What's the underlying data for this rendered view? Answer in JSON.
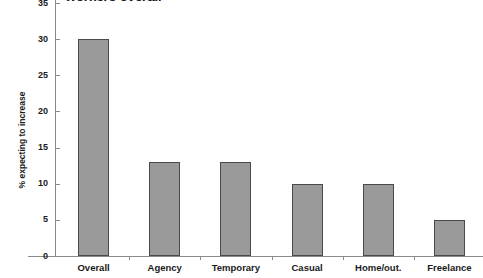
{
  "chart_data": {
    "type": "bar",
    "title": "workers overall",
    "title_clipped": true,
    "xlabel": "",
    "ylabel": "% expecting to increase",
    "categories": [
      "Overall",
      "Agency",
      "Temporary",
      "Casual",
      "Home/out.",
      "Freelance"
    ],
    "values": [
      30,
      13,
      13,
      10,
      10,
      5
    ],
    "ylim": [
      0,
      35
    ],
    "yticks": [
      0,
      5,
      10,
      15,
      20,
      25,
      30,
      35
    ],
    "ytick_labels": [
      "0",
      "5",
      "10",
      "15",
      "20",
      "25",
      "30",
      "35"
    ],
    "grid": false,
    "legend": null,
    "bar_color": "#9a9a9a",
    "bar_border_color": "#4a4a4a",
    "axis_color": "#8a8a8a",
    "background": "#ffffff"
  }
}
